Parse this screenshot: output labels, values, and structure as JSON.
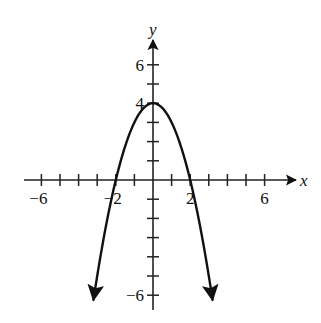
{
  "chart_data": {
    "type": "line",
    "title": "",
    "xlabel": "x",
    "ylabel": "y",
    "function": "y = 4 - x^2",
    "xlim": [
      -7,
      7
    ],
    "ylim": [
      -7,
      7
    ],
    "x_ticks": [
      -6,
      -5,
      -4,
      -3,
      -2,
      -1,
      1,
      2,
      3,
      4,
      5,
      6
    ],
    "y_ticks": [
      -6,
      -5,
      -4,
      -3,
      -2,
      -1,
      1,
      2,
      3,
      4,
      5,
      6
    ],
    "x_tick_labels": [
      {
        "value": -6,
        "label": "−6"
      },
      {
        "value": -2,
        "label": "−2"
      },
      {
        "value": 2,
        "label": "2"
      },
      {
        "value": 6,
        "label": "6"
      }
    ],
    "y_tick_labels": [
      {
        "value": 6,
        "label": "6"
      },
      {
        "value": 4,
        "label": "4"
      },
      {
        "value": -6,
        "label": "−6"
      }
    ],
    "grid": false,
    "legend": null,
    "series": [
      {
        "name": "parabola",
        "x": [
          -3.2,
          -3,
          -2.5,
          -2,
          -1.5,
          -1,
          -0.5,
          0,
          0.5,
          1,
          1.5,
          2,
          2.5,
          3,
          3.2
        ],
        "y": [
          -6.24,
          -5,
          -2.25,
          0,
          1.75,
          3,
          3.75,
          4,
          3.75,
          3,
          1.75,
          0,
          -2.25,
          -5,
          -6.24
        ],
        "arrows_at_ends": true
      }
    ],
    "key_points": {
      "vertex": [
        0,
        4
      ],
      "x_intercepts": [
        -2,
        2
      ]
    }
  },
  "labels": {
    "x_axis": "x",
    "y_axis": "y"
  }
}
